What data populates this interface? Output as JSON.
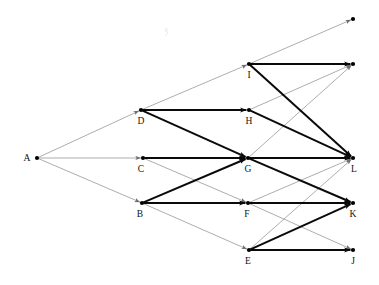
{
  "diagram": {
    "width": 379,
    "height": 285,
    "background_color": "#ffffff",
    "thick_edge_color": "#0a0a0a",
    "thin_edge_color": "#8a8a8a",
    "node_color": "#000000",
    "label_color": "#111111",
    "nodes": [
      {
        "id": "A",
        "label": "A",
        "x": 37,
        "y": 158,
        "label_dx": -10,
        "label_dy": 3,
        "labeled": true
      },
      {
        "id": "B",
        "label": "B",
        "x": 142,
        "y": 203,
        "label_dx": -2,
        "label_dy": 14,
        "labeled": true
      },
      {
        "id": "C",
        "label": "C",
        "x": 143,
        "y": 158,
        "label_dx": -2,
        "label_dy": 14,
        "labeled": true
      },
      {
        "id": "D",
        "label": "D",
        "x": 141,
        "y": 110,
        "label_dx": 0,
        "label_dy": 14,
        "labeled": true
      },
      {
        "id": "E",
        "label": "E",
        "x": 249,
        "y": 250,
        "label_dx": -1,
        "label_dy": 14,
        "labeled": true
      },
      {
        "id": "F",
        "label": "F",
        "x": 248,
        "y": 203,
        "label_dx": -1,
        "label_dy": 14,
        "labeled": true
      },
      {
        "id": "G",
        "label": "G",
        "x": 248,
        "y": 158,
        "label_dx": 0,
        "label_dy": 14,
        "labeled": true
      },
      {
        "id": "H",
        "label": "H",
        "x": 249,
        "y": 110,
        "label_dx": 0,
        "label_dy": 14,
        "labeled": true
      },
      {
        "id": "I",
        "label": "I",
        "x": 249,
        "y": 64,
        "label_dx": 0,
        "label_dy": 14,
        "labeled": true
      },
      {
        "id": "J",
        "label": "J",
        "x": 353,
        "y": 250,
        "label_dx": 0,
        "label_dy": 14,
        "labeled": true
      },
      {
        "id": "K",
        "label": "K",
        "x": 353,
        "y": 203,
        "label_dx": 0,
        "label_dy": 14,
        "labeled": true
      },
      {
        "id": "L",
        "label": "L",
        "x": 353,
        "y": 158,
        "label_dx": 1,
        "label_dy": 14,
        "labeled": true
      },
      {
        "id": "N1",
        "label": "",
        "x": 353,
        "y": 19,
        "label_dx": 0,
        "label_dy": 0,
        "labeled": false
      },
      {
        "id": "N2",
        "label": "",
        "x": 353,
        "y": 64,
        "label_dx": 0,
        "label_dy": 0,
        "labeled": false
      }
    ],
    "edges": [
      {
        "from": "A",
        "to": "D",
        "weight": "thin"
      },
      {
        "from": "A",
        "to": "C",
        "weight": "thin"
      },
      {
        "from": "A",
        "to": "B",
        "weight": "thin"
      },
      {
        "from": "D",
        "to": "I",
        "weight": "thin"
      },
      {
        "from": "D",
        "to": "H",
        "weight": "thick"
      },
      {
        "from": "D",
        "to": "G",
        "weight": "thick"
      },
      {
        "from": "C",
        "to": "G",
        "weight": "thick"
      },
      {
        "from": "C",
        "to": "F",
        "weight": "thin"
      },
      {
        "from": "B",
        "to": "G",
        "weight": "thick"
      },
      {
        "from": "B",
        "to": "F",
        "weight": "thick"
      },
      {
        "from": "B",
        "to": "E",
        "weight": "thin"
      },
      {
        "from": "I",
        "to": "N1",
        "weight": "thin"
      },
      {
        "from": "I",
        "to": "N2",
        "weight": "thick"
      },
      {
        "from": "I",
        "to": "L",
        "weight": "thick"
      },
      {
        "from": "H",
        "to": "N2",
        "weight": "thin"
      },
      {
        "from": "H",
        "to": "L",
        "weight": "thick"
      },
      {
        "from": "G",
        "to": "N2",
        "weight": "thin"
      },
      {
        "from": "G",
        "to": "L",
        "weight": "thick"
      },
      {
        "from": "G",
        "to": "K",
        "weight": "thick"
      },
      {
        "from": "F",
        "to": "L",
        "weight": "thin"
      },
      {
        "from": "F",
        "to": "K",
        "weight": "thick"
      },
      {
        "from": "F",
        "to": "J",
        "weight": "thin"
      },
      {
        "from": "E",
        "to": "L",
        "weight": "thin"
      },
      {
        "from": "E",
        "to": "K",
        "weight": "thick"
      },
      {
        "from": "E",
        "to": "J",
        "weight": "thick"
      }
    ],
    "artifact_mark": {
      "x": 165,
      "y": 32
    }
  }
}
